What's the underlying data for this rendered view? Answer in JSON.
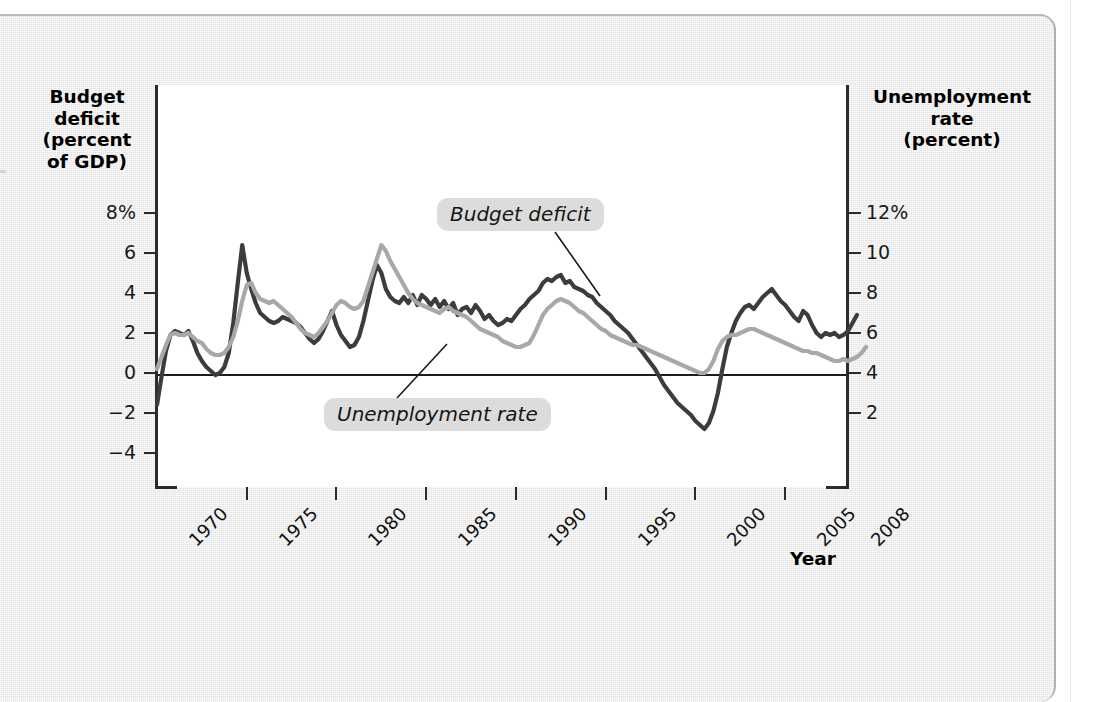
{
  "axes": {
    "left_title": "Budget\ndeficit\n(percent\nof GDP)",
    "left_title_lines": [
      "Budget",
      "deficit",
      "(percent",
      "of GDP)"
    ],
    "right_title_lines": [
      "Unemployment",
      "rate",
      "(percent)"
    ],
    "x_axis_name": "Year",
    "left_ticks": [
      "8%",
      "6",
      "4",
      "2",
      "0",
      "−2",
      "−4"
    ],
    "right_ticks": [
      "12%",
      "10",
      "8",
      "6",
      "4",
      "2"
    ],
    "x_ticks": [
      "1970",
      "1975",
      "1980",
      "1985",
      "1990",
      "1995",
      "2000",
      "2005",
      "2008"
    ]
  },
  "annotations": {
    "budget_deficit": "Budget deficit",
    "unemployment_rate": "Unemployment rate"
  },
  "colors": {
    "budget_deficit_line": "#3c3c3c",
    "unemployment_line": "#a8a8a8",
    "plot_background": "#ffffff",
    "page_background": "#e8e8e8",
    "axis": "#2b2b2b",
    "callout_background": "#dcdcdc"
  },
  "chart_data": {
    "type": "line",
    "title": "",
    "xlabel": "Year",
    "grid": false,
    "legend": "annotations-inline",
    "x_start": 1970,
    "x_end": 2008.5,
    "x_step": 0.25,
    "axes": {
      "left": {
        "label": "Budget deficit (percent of GDP)",
        "ticks": [
          8,
          6,
          4,
          2,
          0,
          -2,
          -4
        ],
        "ylim": [
          -5,
          9
        ]
      },
      "right": {
        "label": "Unemployment rate (percent)",
        "ticks": [
          12,
          10,
          8,
          6,
          4,
          2
        ],
        "ylim": [
          1,
          13
        ]
      }
    },
    "series": [
      {
        "name": "Budget deficit",
        "axis": "left",
        "unit": "percent of GDP",
        "color": "#3c3c3c",
        "values": [
          -1.6,
          -0.2,
          1.1,
          1.9,
          2.1,
          2.0,
          1.9,
          2.1,
          1.6,
          1.0,
          0.6,
          0.3,
          0.1,
          -0.1,
          0.0,
          0.3,
          1.0,
          2.5,
          4.5,
          6.4,
          5.0,
          4.2,
          3.5,
          3.0,
          2.8,
          2.6,
          2.5,
          2.6,
          2.8,
          2.7,
          2.6,
          2.5,
          2.3,
          2.0,
          1.7,
          1.5,
          1.7,
          2.1,
          2.6,
          3.1,
          2.4,
          1.9,
          1.6,
          1.3,
          1.4,
          1.8,
          2.6,
          3.6,
          4.6,
          5.4,
          5.0,
          4.2,
          3.8,
          3.6,
          3.5,
          3.8,
          3.5,
          3.9,
          3.4,
          3.9,
          3.7,
          3.4,
          3.7,
          3.3,
          3.6,
          3.2,
          3.5,
          2.9,
          3.2,
          3.3,
          3.0,
          3.4,
          3.1,
          2.7,
          2.9,
          2.6,
          2.4,
          2.5,
          2.7,
          2.6,
          2.9,
          3.2,
          3.4,
          3.7,
          3.9,
          4.1,
          4.5,
          4.7,
          4.6,
          4.8,
          4.9,
          4.5,
          4.6,
          4.3,
          4.2,
          4.1,
          3.9,
          3.8,
          3.5,
          3.3,
          3.1,
          2.9,
          2.6,
          2.4,
          2.2,
          2.0,
          1.7,
          1.4,
          1.1,
          0.8,
          0.5,
          0.2,
          -0.2,
          -0.6,
          -0.9,
          -1.2,
          -1.5,
          -1.7,
          -1.9,
          -2.1,
          -2.4,
          -2.6,
          -2.8,
          -2.5,
          -1.9,
          -1.0,
          0.2,
          1.3,
          2.0,
          2.6,
          3.0,
          3.3,
          3.4,
          3.2,
          3.5,
          3.8,
          4.0,
          4.2,
          3.9,
          3.6,
          3.4,
          3.1,
          2.8,
          2.6,
          3.1,
          2.9,
          2.4,
          2.0,
          1.8,
          2.0,
          1.9,
          2.0,
          1.8,
          1.9,
          2.1,
          2.5,
          2.9
        ]
      },
      {
        "name": "Unemployment rate",
        "axis": "right",
        "unit": "percent",
        "color": "#a8a8a8",
        "values": [
          4.2,
          4.8,
          5.4,
          5.9,
          6.0,
          5.9,
          5.9,
          6.0,
          5.8,
          5.6,
          5.5,
          5.2,
          5.0,
          4.9,
          4.9,
          5.0,
          5.3,
          5.8,
          6.6,
          7.6,
          8.4,
          8.5,
          8.0,
          7.7,
          7.6,
          7.5,
          7.6,
          7.4,
          7.2,
          7.0,
          6.8,
          6.5,
          6.2,
          6.0,
          5.9,
          5.8,
          6.0,
          6.3,
          6.6,
          7.0,
          7.4,
          7.6,
          7.5,
          7.3,
          7.2,
          7.3,
          7.6,
          8.3,
          9.0,
          9.7,
          10.4,
          10.1,
          9.6,
          9.2,
          8.8,
          8.4,
          8.0,
          7.7,
          7.5,
          7.4,
          7.3,
          7.2,
          7.1,
          7.0,
          7.2,
          7.3,
          7.1,
          7.0,
          6.9,
          6.8,
          6.6,
          6.4,
          6.2,
          6.1,
          6.0,
          5.9,
          5.8,
          5.6,
          5.5,
          5.4,
          5.3,
          5.3,
          5.4,
          5.5,
          5.9,
          6.4,
          6.9,
          7.2,
          7.4,
          7.6,
          7.7,
          7.6,
          7.5,
          7.3,
          7.1,
          7.0,
          6.8,
          6.6,
          6.4,
          6.2,
          6.1,
          5.9,
          5.8,
          5.7,
          5.6,
          5.5,
          5.4,
          5.4,
          5.3,
          5.2,
          5.1,
          5.0,
          4.9,
          4.8,
          4.7,
          4.6,
          4.5,
          4.4,
          4.3,
          4.2,
          4.1,
          4.0,
          4.0,
          4.2,
          4.6,
          5.2,
          5.6,
          5.8,
          5.9,
          5.9,
          6.0,
          6.1,
          6.2,
          6.2,
          6.1,
          6.0,
          5.9,
          5.8,
          5.7,
          5.6,
          5.5,
          5.4,
          5.3,
          5.2,
          5.1,
          5.1,
          5.0,
          5.0,
          4.9,
          4.8,
          4.7,
          4.6,
          4.6,
          4.7,
          4.6,
          4.7,
          4.8,
          5.0,
          5.3
        ]
      }
    ]
  }
}
